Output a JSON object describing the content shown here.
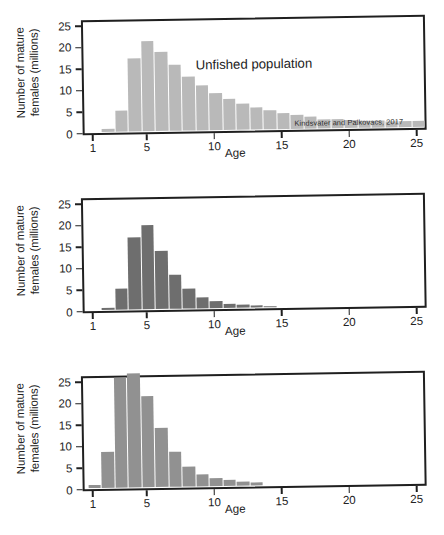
{
  "figure": {
    "credit": "Kindsvater and Palkovacs, 2017",
    "y_axis_label": "Number of mature\nfemales (millions)",
    "x_axis_label": "Age",
    "y_ticks": [
      "0",
      "5",
      "10",
      "15",
      "20",
      "25"
    ],
    "x_ticks": [
      "1",
      "5",
      "10",
      "15",
      "20",
      "25"
    ]
  },
  "colors": {
    "panel1_bar": "#b9b9b9",
    "panel2_bar": "#6e6e6e",
    "panel3_bar": "#919191",
    "axis": "#1f1f1f",
    "text": "#232323",
    "background": "#ffffff"
  },
  "panels": [
    {
      "id": "unfished-population",
      "annotation": "Unfished population",
      "bar_color": "#b9b9b9"
    },
    {
      "id": "size-selected-fish-population",
      "annotation": "Size-selected fish population",
      "bar_color": "#6e6e6e"
    },
    {
      "id": "decreased-maturation-age",
      "annotation": "Decreased maturation age\ndue to size-selective fishing",
      "bar_color": "#919191"
    }
  ],
  "chart_data": [
    {
      "type": "bar",
      "title": "Unfished population",
      "annotation": "Unfished population",
      "credit": "Kindsvater and Palkovacs, 2017",
      "xlabel": "Age",
      "ylabel": "Number of mature females (millions)",
      "xlim": [
        0.4,
        25.6
      ],
      "ylim": [
        0,
        26
      ],
      "yticks": [
        0,
        5,
        10,
        15,
        20,
        25
      ],
      "xticks": [
        1,
        5,
        10,
        15,
        20,
        25
      ],
      "grid": false,
      "legend": null,
      "color": "#b9b9b9",
      "categories": [
        1,
        2,
        3,
        4,
        5,
        6,
        7,
        8,
        9,
        10,
        11,
        12,
        13,
        14,
        15,
        16,
        17,
        18,
        19,
        20,
        21,
        22,
        23,
        24,
        25
      ],
      "values": [
        0.0,
        0.6,
        4.9,
        16.9,
        20.9,
        18.3,
        15.3,
        12.6,
        10.4,
        8.6,
        7.2,
        6.1,
        5.1,
        4.4,
        3.7,
        3.2,
        2.7,
        2.2,
        2.0,
        1.9,
        1.7,
        1.6,
        1.5,
        1.4,
        1.3
      ]
    },
    {
      "type": "bar",
      "title": "Size-selected fish population",
      "annotation": "Size-selected fish population",
      "credit": "Kindsvater and Palkovacs, 2017",
      "xlabel": "Age",
      "ylabel": "Number of mature females (millions)",
      "xlim": [
        0.4,
        25.6
      ],
      "ylim": [
        0,
        26
      ],
      "yticks": [
        0,
        5,
        10,
        15,
        20,
        25
      ],
      "xticks": [
        1,
        5,
        10,
        15,
        20,
        25
      ],
      "grid": false,
      "legend": null,
      "color": "#6e6e6e",
      "categories": [
        1,
        2,
        3,
        4,
        5,
        6,
        7,
        8,
        9,
        10,
        11,
        12,
        13,
        14,
        15,
        16,
        17,
        18,
        19,
        20,
        21,
        22,
        23,
        24,
        25
      ],
      "values": [
        0.0,
        0.5,
        4.8,
        16.8,
        19.4,
        13.5,
        7.9,
        4.6,
        2.6,
        1.6,
        1.0,
        0.6,
        0.4,
        0.3,
        0.0,
        0.0,
        0.0,
        0.0,
        0.0,
        0.0,
        0.0,
        0.0,
        0.0,
        0.0,
        0.0
      ]
    },
    {
      "type": "bar",
      "title": "Decreased maturation age due to size-selective fishing",
      "annotation": "Decreased maturation age\ndue to size-selective fishing",
      "credit": "Kindsvater and Palkovacs, 2017",
      "xlabel": "Age",
      "ylabel": "Number of mature females (millions)",
      "xlim": [
        0.4,
        25.6
      ],
      "ylim": [
        0,
        26
      ],
      "yticks": [
        0,
        5,
        10,
        15,
        20,
        25
      ],
      "xticks": [
        1,
        5,
        10,
        15,
        20,
        25
      ],
      "grid": false,
      "legend": null,
      "color": "#919191",
      "categories": [
        1,
        2,
        3,
        4,
        5,
        6,
        7,
        8,
        9,
        10,
        11,
        12,
        13,
        14,
        15,
        16,
        17,
        18,
        19,
        20,
        21,
        22,
        23,
        24,
        25
      ],
      "values": [
        0.6,
        8.3,
        25.6,
        26.4,
        21.2,
        13.8,
        8.1,
        4.6,
        2.7,
        1.9,
        1.3,
        0.9,
        0.6,
        0.0,
        0.0,
        0.0,
        0.0,
        0.0,
        0.0,
        0.0,
        0.0,
        0.0,
        0.0,
        0.0,
        0.0
      ]
    }
  ]
}
